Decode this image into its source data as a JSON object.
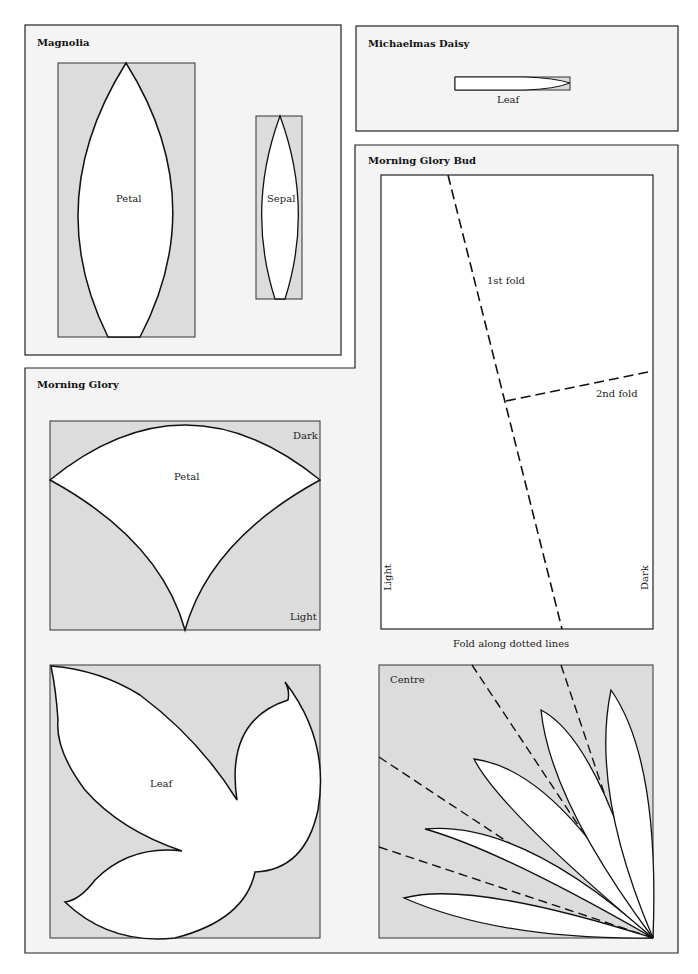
{
  "colors": {
    "panel_bg": "#f4f4f4",
    "template_bg": "#dcdcdc",
    "cut_fill": "#ffffff",
    "line": "#111111"
  },
  "magnolia": {
    "title": "Magnolia",
    "petal_label": "Petal",
    "sepal_label": "Sepal"
  },
  "daisy": {
    "title": "Michaelmas Daisy",
    "leaf_label": "Leaf"
  },
  "bud": {
    "title": "Morning Glory Bud",
    "fold1": "1st fold",
    "fold2": "2nd fold",
    "light": "Light",
    "dark": "Dark",
    "caption": "Fold along dotted lines"
  },
  "glory": {
    "title": "Morning Glory",
    "petal_label": "Petal",
    "dark": "Dark",
    "light": "Light",
    "leaf_label": "Leaf",
    "centre_label": "Centre"
  }
}
